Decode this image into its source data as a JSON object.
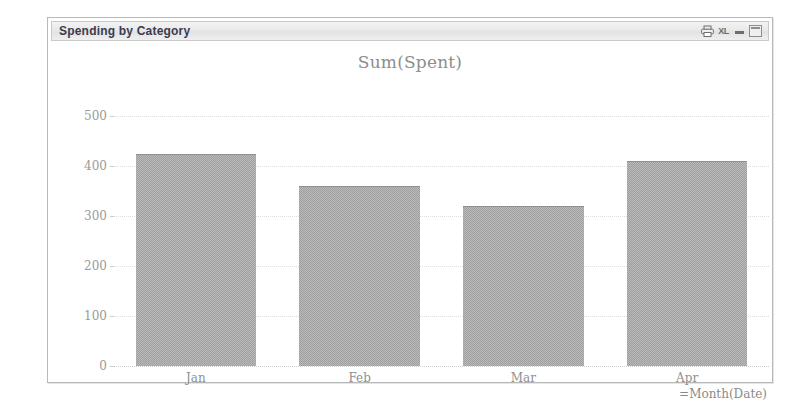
{
  "window": {
    "title": "Spending by Category",
    "controls": [
      {
        "name": "print-icon",
        "label": ""
      },
      {
        "name": "export-to-excel-icon",
        "label": "XL"
      },
      {
        "name": "minimize-button",
        "label": ""
      },
      {
        "name": "maximize-button",
        "label": ""
      }
    ]
  },
  "chart_data": {
    "type": "bar",
    "title": "Sum(Spent)",
    "xlabel": "=Month(Date)",
    "ylabel": "",
    "categories": [
      "Jan",
      "Feb",
      "Mar",
      "Apr"
    ],
    "values": [
      425,
      360,
      320,
      410
    ],
    "yticks": [
      500,
      400,
      300,
      200,
      100,
      0
    ],
    "ytick_labels": [
      "500",
      "400",
      "300",
      "200",
      "100",
      "0"
    ],
    "ylim": [
      0,
      500
    ],
    "grid": true,
    "legend": false,
    "bar_color": "#9e9e9e",
    "series": [
      {
        "name": "Sum(Spent)",
        "values": [
          425,
          360,
          320,
          410
        ]
      }
    ]
  },
  "colors": {
    "bar": "#9e9e9e",
    "grid": "#dededc",
    "axis_text": "#9a9a9a",
    "title_text": "#8e8e8e",
    "window_title_text": "#3b3b4f",
    "window_border": "#b8b8b8"
  }
}
